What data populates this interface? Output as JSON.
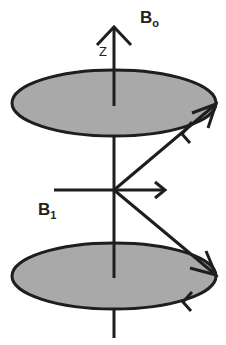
{
  "diagram": {
    "labels": {
      "z_axis": "Z",
      "b0_main": "B",
      "b0_sub": "o",
      "b1_main": "B",
      "b1_sub": "1"
    },
    "colors": {
      "stroke": "#1e1e1e",
      "ellipse_fill": "#a9a9a9",
      "background": "#ffffff"
    },
    "elements": [
      "z-axis with arrowhead",
      "top precession ellipse",
      "bottom precession ellipse",
      "B1 horizontal field arrow",
      "upper magnetization vector",
      "lower magnetization vector",
      "rotation direction arrows on ellipses"
    ]
  }
}
